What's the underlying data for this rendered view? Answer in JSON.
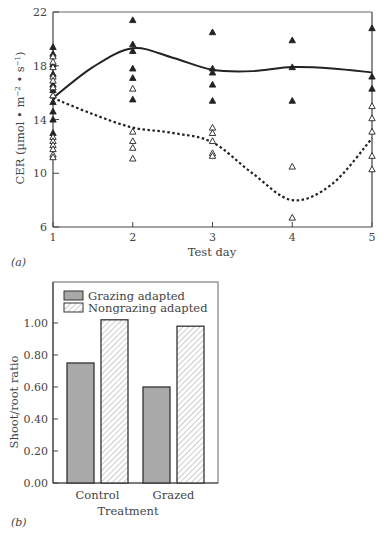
{
  "chart_data": [
    {
      "panel": "(a)",
      "type": "scatter",
      "xlabel": "Test day",
      "ylabel": "CER (µmol • m⁻² • s⁻¹)",
      "ylabel_parts": {
        "main": "CER (µmol • m",
        "sup1": "−2",
        "mid": " • s",
        "sup2": "−1",
        "end": ")"
      },
      "x_ticks": [
        1,
        2,
        3,
        4,
        5
      ],
      "y_ticks": [
        6,
        10,
        14,
        18,
        22
      ],
      "xlim": [
        1,
        5
      ],
      "ylim": [
        6,
        22
      ],
      "grid": false,
      "series": [
        {
          "name": "Grazing adapted",
          "marker": "filled-triangle",
          "points": [
            [
              1,
              19.4
            ],
            [
              1,
              18.9
            ],
            [
              1,
              18.1
            ],
            [
              1,
              17.4
            ],
            [
              1,
              16.6
            ],
            [
              1,
              16.2
            ],
            [
              1,
              15.8
            ],
            [
              1,
              15.3
            ],
            [
              1,
              14.6
            ],
            [
              1,
              14.0
            ],
            [
              1,
              13.0
            ],
            [
              2,
              21.4
            ],
            [
              2,
              19.6
            ],
            [
              2,
              19.1
            ],
            [
              2,
              17.8
            ],
            [
              2,
              17.1
            ],
            [
              2,
              15.5
            ],
            [
              3,
              20.5
            ],
            [
              3,
              17.8
            ],
            [
              3,
              17.5
            ],
            [
              3,
              16.6
            ],
            [
              3,
              15.4
            ],
            [
              4,
              19.9
            ],
            [
              4,
              17.9
            ],
            [
              4,
              15.4
            ],
            [
              5,
              20.8
            ],
            [
              5,
              17.2
            ],
            [
              5,
              16.3
            ]
          ]
        },
        {
          "name": "Nongrazing adapted",
          "marker": "open-triangle",
          "points": [
            [
              1,
              18.7
            ],
            [
              1,
              18.3
            ],
            [
              1,
              17.9
            ],
            [
              1,
              17.2
            ],
            [
              1,
              16.9
            ],
            [
              1,
              16.4
            ],
            [
              1,
              15.8
            ],
            [
              1,
              12.7
            ],
            [
              1,
              12.4
            ],
            [
              1,
              12.1
            ],
            [
              1,
              11.8
            ],
            [
              1,
              11.4
            ],
            [
              1,
              11.2
            ],
            [
              2,
              16.3
            ],
            [
              2,
              13.1
            ],
            [
              2,
              12.4
            ],
            [
              2,
              11.9
            ],
            [
              2,
              11.1
            ],
            [
              3,
              13.4
            ],
            [
              3,
              13.0
            ],
            [
              3,
              12.4
            ],
            [
              3,
              11.5
            ],
            [
              3,
              11.3
            ],
            [
              4,
              10.5
            ],
            [
              4,
              6.7
            ],
            [
              5,
              15.0
            ],
            [
              5,
              14.1
            ],
            [
              5,
              13.1
            ],
            [
              5,
              11.3
            ],
            [
              5,
              10.3
            ]
          ]
        }
      ],
      "fit_curves": [
        {
          "name": "Grazing adapted fit",
          "style": "solid",
          "points": [
            [
              1,
              15.6
            ],
            [
              1.5,
              17.9
            ],
            [
              2,
              19.3
            ],
            [
              2.5,
              18.6
            ],
            [
              3,
              17.7
            ],
            [
              3.5,
              17.6
            ],
            [
              4,
              17.9
            ],
            [
              4.5,
              17.8
            ],
            [
              5,
              17.5
            ]
          ]
        },
        {
          "name": "Nongrazing adapted fit",
          "style": "dotted",
          "points": [
            [
              1,
              15.6
            ],
            [
              1.5,
              14.4
            ],
            [
              2,
              13.4
            ],
            [
              2.5,
              13.0
            ],
            [
              3,
              12.3
            ],
            [
              3.5,
              10.0
            ],
            [
              4,
              8.0
            ],
            [
              4.5,
              9.2
            ],
            [
              5,
              12.6
            ]
          ]
        }
      ]
    },
    {
      "panel": "(b)",
      "type": "bar",
      "xlabel": "Treatment",
      "ylabel": "Shoot/root ratio",
      "categories": [
        "Control",
        "Grazed"
      ],
      "y_ticks": [
        "0.00",
        "0.20",
        "0.40",
        "0.60",
        "0.80",
        "1.00"
      ],
      "ylim": [
        0,
        1.2
      ],
      "grid": false,
      "legend_position": "top-left inside",
      "series": [
        {
          "name": "Grazing adapted",
          "fill": "solid-gray",
          "color": "#a9a9a9",
          "values": [
            0.75,
            0.6
          ]
        },
        {
          "name": "Nongrazing adapted",
          "fill": "hatched",
          "color": "#ffffff",
          "values": [
            1.02,
            0.98
          ]
        }
      ]
    }
  ],
  "panel_a": {
    "label": "(a)",
    "xlabel": "Test day",
    "ylabel_main": "CER (µmol • m",
    "ylabel_sup1": "−2",
    "ylabel_mid": " • s",
    "ylabel_sup2": "−1",
    "ylabel_end": ")",
    "y_tick_labels": [
      "22",
      "18",
      "14",
      "10",
      "6"
    ],
    "x_tick_labels": [
      "1",
      "2",
      "3",
      "4",
      "5"
    ]
  },
  "panel_b": {
    "label": "(b)",
    "xlabel": "Treatment",
    "ylabel": "Shoot/root ratio",
    "y_tick_labels": [
      "1.00",
      "0.80",
      "0.60",
      "0.40",
      "0.20",
      "0.00"
    ],
    "categories": [
      "Control",
      "Grazed"
    ],
    "legend": [
      "Grazing adapted",
      "Nongrazing adapted"
    ]
  },
  "colors": {
    "axis": "#555555",
    "bar_gray": "#a9a9a9",
    "bar_outline": "#333333",
    "marker": "#222222"
  }
}
